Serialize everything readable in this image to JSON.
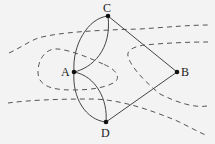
{
  "diagram": {
    "type": "graph-over-map",
    "colors": {
      "background": "#f3f3f3",
      "edge": "#444444",
      "node": "#111111",
      "boundary": "#555555"
    },
    "nodes": [
      {
        "id": "A",
        "label": "A",
        "x": 74,
        "y": 72
      },
      {
        "id": "B",
        "label": "B",
        "x": 177,
        "y": 72
      },
      {
        "id": "C",
        "label": "C",
        "x": 108,
        "y": 16
      },
      {
        "id": "D",
        "label": "D",
        "x": 106,
        "y": 122
      }
    ],
    "edges": [
      {
        "from": "A",
        "to": "C",
        "style": "curve-left"
      },
      {
        "from": "A",
        "to": "C",
        "style": "curve-right"
      },
      {
        "from": "A",
        "to": "D",
        "style": "curve-left"
      },
      {
        "from": "A",
        "to": "D",
        "style": "curve-right"
      },
      {
        "from": "C",
        "to": "B",
        "style": "straight"
      },
      {
        "from": "D",
        "to": "B",
        "style": "straight"
      }
    ],
    "boundaries": [
      {
        "name": "upper-bank",
        "style": "dashed"
      },
      {
        "name": "island-left",
        "style": "dashed"
      },
      {
        "name": "island-right",
        "style": "dashed"
      },
      {
        "name": "lower-bank",
        "style": "dashed"
      }
    ]
  }
}
